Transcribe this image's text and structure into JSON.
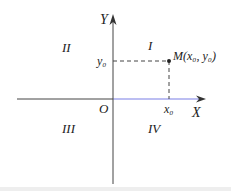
{
  "diagram": {
    "axes": {
      "x_label": "X",
      "y_label": "Y",
      "origin_label": "O",
      "x_axis_color_positive": "#6a6ee0",
      "axis_color": "#333333"
    },
    "quadrants": {
      "q1": "I",
      "q2": "II",
      "q3": "III",
      "q4": "IV"
    },
    "point": {
      "name": "M",
      "label": "M(x₀, y₀)",
      "x_tick": "x₀",
      "y_tick": "y₀"
    }
  }
}
